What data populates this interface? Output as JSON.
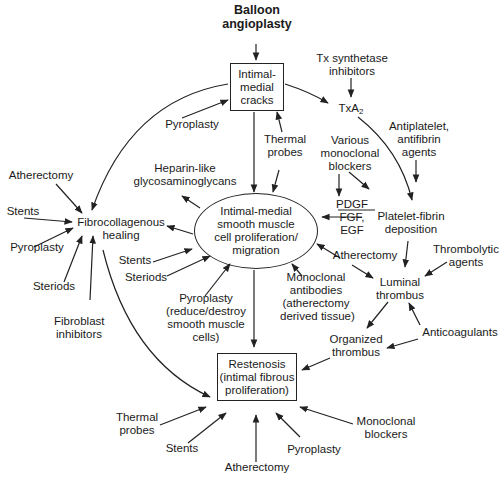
{
  "nodes": {
    "balloon": [
      "Balloon",
      "angioplasty"
    ],
    "cracks": [
      "Intimal-",
      "medial",
      "cracks"
    ],
    "tx_inhib": [
      "Tx synthetase",
      "inhibitors"
    ],
    "txa2": "TxA",
    "txa2_sub": "2",
    "pyroplasty_top": "Pyroplasty",
    "thermal_top": [
      "Thermal",
      "probes"
    ],
    "heparin": [
      "Heparin-like",
      "glycosaminoglycans"
    ],
    "various_mono": [
      "Various",
      "monoclonal",
      "blockers"
    ],
    "antiplatelet": [
      "Antiplatelet,",
      "antifibrin",
      "agents"
    ],
    "atherectomy_left": "Atherectomy",
    "stents_left": "Stents",
    "pyroplasty_left": "Pyroplasty",
    "steriods_left": "Steriods",
    "fibroblast": [
      "Fibroblast",
      "inhibitors"
    ],
    "fibro_healing": [
      "Fibrocollagenous",
      "healing"
    ],
    "smc": [
      "Intimal-medial",
      "smooth muscle",
      "cell proliferation/",
      "migration"
    ],
    "growth_factors": [
      "PDGF",
      "FGF,",
      "EGF"
    ],
    "platelet_fibrin": [
      "Platelet-fibrin",
      "deposition"
    ],
    "stents_mid": "Stents",
    "steriods_mid": "Steriods",
    "atherectomy_mid": "Atherectomy",
    "thrombolytic": [
      "Thrombolytic",
      "agents"
    ],
    "mono_antibodies": [
      "Monoclonal",
      "antibodies",
      "(atherectomy",
      "derived tissue)"
    ],
    "luminal": [
      "Luminal",
      "thrombus"
    ],
    "pyroplasty_mid": [
      "Pyroplasty",
      "(reduce/destroy",
      "smooth muscle",
      "cells)"
    ],
    "anticoag": "Anticoagulants",
    "organized": [
      "Organized",
      "thrombus"
    ],
    "restenosis": [
      "Restenosis",
      "(intimal fibrous",
      "proliferation)"
    ],
    "thermal_bottom": [
      "Thermal",
      "probes"
    ],
    "stents_bottom": "Stents",
    "atherectomy_bottom": "Atherectomy",
    "pyroplasty_bottom": "Pyroplasty",
    "mono_blockers_bottom": [
      "Monoclonal",
      "blockers"
    ]
  },
  "colors": {
    "line": "#222222",
    "text": "#1a1a1a",
    "background": "#ffffff"
  }
}
